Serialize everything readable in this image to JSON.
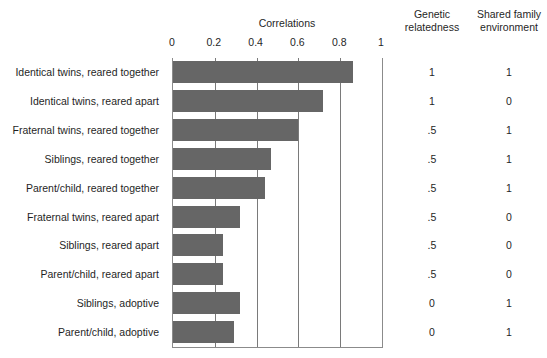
{
  "chart_data": {
    "type": "bar",
    "title": "Correlations",
    "xlabel": "",
    "ylabel": "",
    "orientation": "horizontal",
    "xlim": [
      0,
      1
    ],
    "xticks": [
      0,
      0.2,
      0.4,
      0.6,
      0.8,
      1
    ],
    "xtick_labels": [
      "0",
      "0.2",
      "0.4",
      "0.6",
      "0.8",
      "1"
    ],
    "grid": "vertical gridlines at 0.2, 0.4, 0.6, 0.8",
    "legend": "none",
    "bar_color": "#666666",
    "categories": [
      "Identical twins, reared together",
      "Identical twins, reared apart",
      "Fraternal twins, reared together",
      "Siblings, reared together",
      "Parent/child, reared together",
      "Fraternal twins, reared apart",
      "Siblings, reared apart",
      "Parent/child, reared apart",
      "Siblings, adoptive",
      "Parent/child, adoptive"
    ],
    "values": [
      0.86,
      0.72,
      0.6,
      0.47,
      0.44,
      0.32,
      0.24,
      0.24,
      0.32,
      0.29
    ],
    "annotation_columns": [
      {
        "header": "Genetic\nrelatedness",
        "values": [
          "1",
          "1",
          ".5",
          ".5",
          ".5",
          ".5",
          ".5",
          ".5",
          "0",
          "0"
        ]
      },
      {
        "header": "Shared family\nenvironment",
        "values": [
          "1",
          "0",
          "1",
          "1",
          "1",
          "0",
          "0",
          "0",
          "1",
          "1"
        ]
      }
    ]
  }
}
